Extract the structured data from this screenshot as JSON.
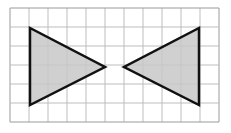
{
  "diagram": {
    "grid": {
      "x": 10,
      "y": 8,
      "cols": 11,
      "rows": 6,
      "cell": 19,
      "line_color": "#bdbdbd",
      "border_color": "#9a9a9a"
    },
    "shapes": [
      {
        "name": "left-triangle",
        "points": "30,28 30,105 105,67",
        "fill": "#c8c8c8",
        "stroke": "#111111"
      },
      {
        "name": "right-triangle",
        "points": "199,28 199,105 124,67",
        "fill": "#c8c8c8",
        "stroke": "#111111"
      }
    ]
  }
}
